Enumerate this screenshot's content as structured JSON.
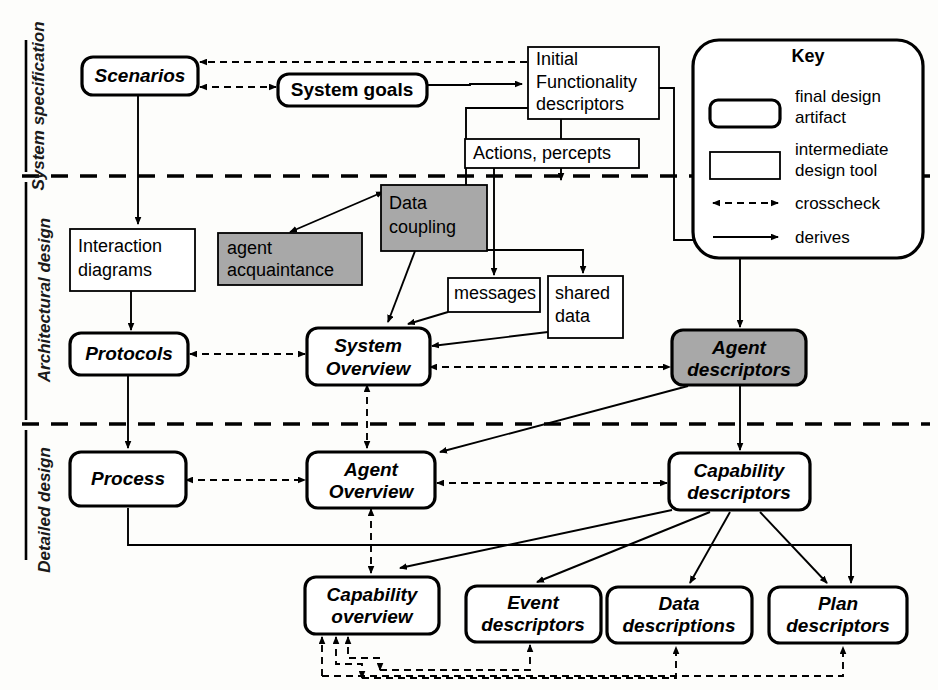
{
  "diagram": {
    "colors": {
      "gray_fill": "#a8a8a8",
      "white_fill": "#ffffff",
      "stroke": "#000000",
      "background": "#fdfdfb"
    },
    "phases": [
      {
        "id": "phase-system-specification",
        "label": "System specification"
      },
      {
        "id": "phase-architectural-design",
        "label": "Architectural design"
      },
      {
        "id": "phase-detailed-design",
        "label": "Detailed design"
      }
    ],
    "nodes": [
      {
        "id": "scenarios",
        "label": "Scenarios",
        "kind": "final-artifact",
        "shaded": false
      },
      {
        "id": "system-goals",
        "label": "System goals",
        "kind": "final-artifact",
        "shaded": false
      },
      {
        "id": "initial-functionality-descriptors",
        "label": "Initial\nFunctionality\ndescriptors",
        "kind": "intermediate",
        "shaded": false
      },
      {
        "id": "actions-percepts",
        "label": "Actions, percepts",
        "kind": "intermediate",
        "shaded": false
      },
      {
        "id": "interaction-diagrams",
        "label": "Interaction\ndiagrams",
        "kind": "intermediate",
        "shaded": false
      },
      {
        "id": "agent-acquaintance",
        "label": "agent\nacquaintance",
        "kind": "intermediate",
        "shaded": true
      },
      {
        "id": "data-coupling",
        "label": "Data\ncoupling",
        "kind": "intermediate",
        "shaded": true
      },
      {
        "id": "messages",
        "label": "messages",
        "kind": "intermediate",
        "shaded": false
      },
      {
        "id": "shared-data",
        "label": "shared\ndata",
        "kind": "intermediate",
        "shaded": false
      },
      {
        "id": "protocols",
        "label": "Protocols",
        "kind": "final-artifact",
        "shaded": false
      },
      {
        "id": "system-overview",
        "label": "System\nOverview",
        "kind": "final-artifact",
        "shaded": false
      },
      {
        "id": "agent-descriptors",
        "label": "Agent\ndescriptors",
        "kind": "final-artifact",
        "shaded": true
      },
      {
        "id": "process",
        "label": "Process",
        "kind": "final-artifact",
        "shaded": false
      },
      {
        "id": "agent-overview",
        "label": "Agent\nOverview",
        "kind": "final-artifact",
        "shaded": false
      },
      {
        "id": "capability-descriptors",
        "label": "Capability\ndescriptors",
        "kind": "final-artifact",
        "shaded": false
      },
      {
        "id": "capability-overview",
        "label": "Capability\noverview",
        "kind": "final-artifact",
        "shaded": false
      },
      {
        "id": "event-descriptors",
        "label": "Event\ndescriptors",
        "kind": "final-artifact",
        "shaded": false
      },
      {
        "id": "data-descriptions",
        "label": "Data\ndescriptions",
        "kind": "final-artifact",
        "shaded": false
      },
      {
        "id": "plan-descriptors",
        "label": "Plan\ndescriptors",
        "kind": "final-artifact",
        "shaded": false
      }
    ],
    "edges": [
      {
        "from": "initial-functionality-descriptors",
        "to": "scenarios",
        "type": "crosscheck"
      },
      {
        "from": "scenarios",
        "to": "system-goals",
        "type": "crosscheck"
      },
      {
        "from": "system-goals",
        "to": "initial-functionality-descriptors",
        "type": "derives"
      },
      {
        "from": "scenarios",
        "to": "interaction-diagrams",
        "type": "derives"
      },
      {
        "from": "initial-functionality-descriptors",
        "to": "data-coupling",
        "type": "derives"
      },
      {
        "from": "data-coupling",
        "to": "agent-acquaintance",
        "type": "derives-both"
      },
      {
        "from": "interaction-diagrams",
        "to": "protocols",
        "type": "derives"
      },
      {
        "from": "data-coupling",
        "to": "system-overview",
        "type": "derives"
      },
      {
        "from": "actions-percepts",
        "to": "messages",
        "type": "derives"
      },
      {
        "from": "initial-functionality-descriptors",
        "to": "shared-data",
        "type": "derives"
      },
      {
        "from": "messages",
        "to": "system-overview",
        "type": "derives"
      },
      {
        "from": "shared-data",
        "to": "system-overview",
        "type": "derives"
      },
      {
        "from": "protocols",
        "to": "system-overview",
        "type": "crosscheck"
      },
      {
        "from": "system-overview",
        "to": "agent-descriptors",
        "type": "crosscheck"
      },
      {
        "from": "initial-functionality-descriptors",
        "to": "agent-descriptors",
        "type": "derives"
      },
      {
        "from": "agent-descriptors",
        "to": "agent-overview",
        "type": "derives"
      },
      {
        "from": "system-overview",
        "to": "agent-overview",
        "type": "crosscheck"
      },
      {
        "from": "protocols",
        "to": "process",
        "type": "derives"
      },
      {
        "from": "process",
        "to": "agent-overview",
        "type": "crosscheck"
      },
      {
        "from": "agent-descriptors",
        "to": "capability-descriptors",
        "type": "derives"
      },
      {
        "from": "agent-overview",
        "to": "capability-descriptors",
        "type": "crosscheck"
      },
      {
        "from": "agent-overview",
        "to": "capability-overview",
        "type": "crosscheck"
      },
      {
        "from": "capability-descriptors",
        "to": "capability-overview",
        "type": "derives"
      },
      {
        "from": "capability-descriptors",
        "to": "event-descriptors",
        "type": "derives"
      },
      {
        "from": "capability-descriptors",
        "to": "data-descriptions",
        "type": "derives"
      },
      {
        "from": "capability-descriptors",
        "to": "plan-descriptors",
        "type": "derives"
      },
      {
        "from": "process",
        "to": "plan-descriptors",
        "type": "derives"
      },
      {
        "from": "event-descriptors",
        "to": "capability-overview",
        "type": "crosscheck"
      },
      {
        "from": "data-descriptions",
        "to": "capability-overview",
        "type": "crosscheck"
      },
      {
        "from": "plan-descriptors",
        "to": "capability-overview",
        "type": "crosscheck"
      }
    ]
  },
  "key": {
    "title": "Key",
    "items": [
      {
        "id": "key-final-artifact",
        "label": "final design\nartifact",
        "glyph": "rounded-thick-rect"
      },
      {
        "id": "key-intermediate",
        "label": "intermediate\ndesign tool",
        "glyph": "thin-rect"
      },
      {
        "id": "key-crosscheck",
        "label": "crosscheck",
        "glyph": "dashed-double-arrow"
      },
      {
        "id": "key-derives",
        "label": "derives",
        "glyph": "solid-arrow"
      }
    ]
  }
}
